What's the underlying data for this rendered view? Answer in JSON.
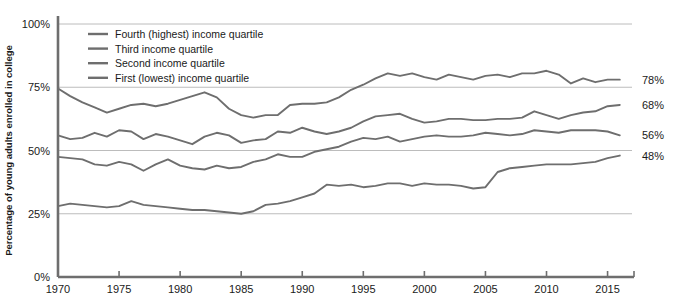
{
  "chart_data": {
    "type": "line",
    "title": "",
    "xlabel": "",
    "ylabel": "Percentage of young adults enrolled in college",
    "xlim": [
      1970,
      2017
    ],
    "ylim": [
      0,
      100
    ],
    "grid": true,
    "legend_position": "top-left",
    "y_ticks": [
      "0%",
      "25%",
      "50%",
      "75%",
      "100%"
    ],
    "y_tick_values": [
      0,
      25,
      50,
      75,
      100
    ],
    "x_ticks": [
      "1970",
      "1975",
      "1980",
      "1985",
      "1990",
      "1995",
      "2000",
      "2005",
      "2010",
      "2015"
    ],
    "x_tick_values": [
      1970,
      1975,
      1980,
      1985,
      1990,
      1995,
      2000,
      2005,
      2010,
      2015
    ],
    "line_color": "#6e6e6e",
    "grid_color": "#b4b4b4",
    "axis_color": "#6e6e6e",
    "x": [
      1970,
      1971,
      1972,
      1973,
      1974,
      1975,
      1976,
      1977,
      1978,
      1979,
      1980,
      1981,
      1982,
      1983,
      1984,
      1985,
      1986,
      1987,
      1988,
      1989,
      1990,
      1991,
      1992,
      1993,
      1994,
      1995,
      1996,
      1997,
      1998,
      1999,
      2000,
      2001,
      2002,
      2003,
      2004,
      2005,
      2006,
      2007,
      2008,
      2009,
      2010,
      2011,
      2012,
      2013,
      2014,
      2015,
      2016
    ],
    "series": [
      {
        "name": "Fourth (highest) income quartile",
        "end_label": "78%",
        "values": [
          74.5,
          71.5,
          69.0,
          67.0,
          65.0,
          66.5,
          68.0,
          68.5,
          67.5,
          68.5,
          70.0,
          71.5,
          73.0,
          71.0,
          66.5,
          64.0,
          63.0,
          64.0,
          64.0,
          68.0,
          68.5,
          68.5,
          69.0,
          71.0,
          74.0,
          76.0,
          78.5,
          80.5,
          79.5,
          80.5,
          79.0,
          78.0,
          80.0,
          79.0,
          78.0,
          79.5,
          80.0,
          79.0,
          80.5,
          80.5,
          81.5,
          80.0,
          76.5,
          78.5,
          77.0,
          78.0,
          78.0
        ]
      },
      {
        "name": "Third income quartile",
        "end_label": "68%",
        "values": [
          56.0,
          54.5,
          55.0,
          57.0,
          55.5,
          58.0,
          57.5,
          54.5,
          56.5,
          55.5,
          54.0,
          52.5,
          55.5,
          57.0,
          56.0,
          53.0,
          54.0,
          54.5,
          57.5,
          57.0,
          59.0,
          57.5,
          56.5,
          57.5,
          59.0,
          61.5,
          63.5,
          64.0,
          64.5,
          62.5,
          61.0,
          61.5,
          62.5,
          62.5,
          62.0,
          62.0,
          62.5,
          62.5,
          63.0,
          65.5,
          64.0,
          62.5,
          64.0,
          65.0,
          65.5,
          67.5,
          68.0
        ]
      },
      {
        "name": "Second income quartile",
        "end_label": "56%",
        "values": [
          47.5,
          47.0,
          46.5,
          44.5,
          44.0,
          45.5,
          44.5,
          42.0,
          44.5,
          46.5,
          44.0,
          43.0,
          42.5,
          44.0,
          43.0,
          43.5,
          45.5,
          46.5,
          48.5,
          47.5,
          47.5,
          49.5,
          50.5,
          51.5,
          53.5,
          55.0,
          54.5,
          55.5,
          53.5,
          54.5,
          55.5,
          56.0,
          55.5,
          55.5,
          56.0,
          57.0,
          56.5,
          56.0,
          56.5,
          58.0,
          57.5,
          57.0,
          58.0,
          58.0,
          58.0,
          57.5,
          56.0
        ]
      },
      {
        "name": "First (lowest) income quartile",
        "end_label": "48%",
        "values": [
          28.0,
          29.0,
          28.5,
          28.0,
          27.5,
          28.0,
          30.0,
          28.5,
          28.0,
          27.5,
          27.0,
          26.5,
          26.5,
          26.0,
          25.5,
          25.0,
          26.0,
          28.5,
          29.0,
          30.0,
          31.5,
          33.0,
          36.5,
          36.0,
          36.5,
          35.5,
          36.0,
          37.0,
          37.0,
          36.0,
          37.0,
          36.5,
          36.5,
          36.0,
          35.0,
          35.5,
          41.5,
          43.0,
          43.5,
          44.0,
          44.5,
          44.5,
          44.5,
          45.0,
          45.5,
          47.0,
          48.0
        ]
      }
    ]
  }
}
